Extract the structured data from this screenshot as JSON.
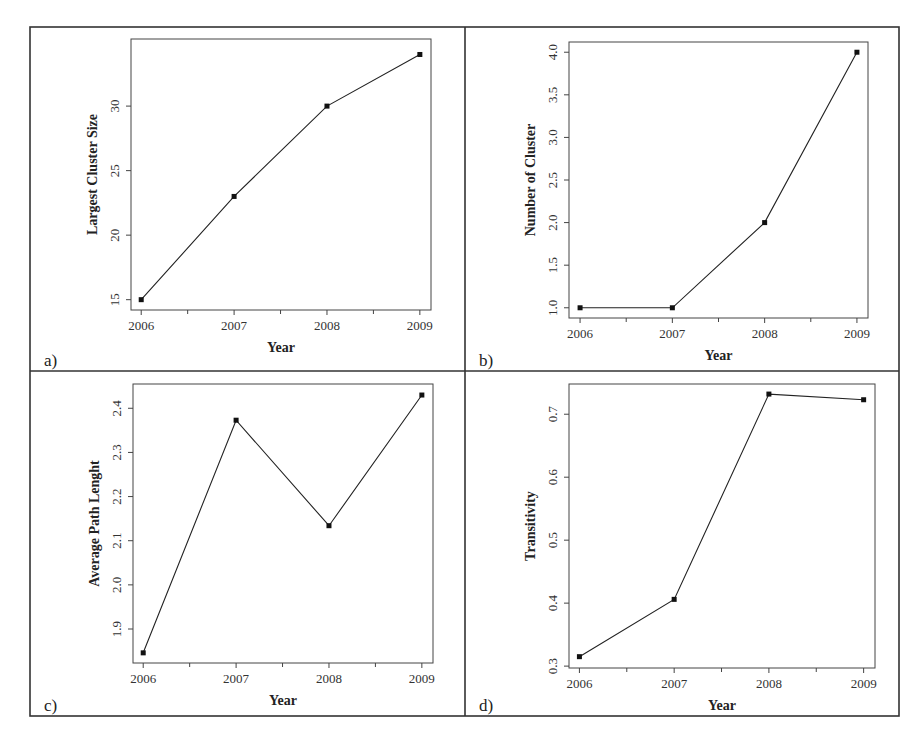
{
  "figure": {
    "layout": "2x2 grid of line charts",
    "frame_color": "#333333"
  },
  "chart_data": [
    {
      "id": "a",
      "panel_label": "a)",
      "type": "line",
      "title": "",
      "xlabel": "Year",
      "ylabel": "Largest Cluster Size",
      "x": [
        2006,
        2007,
        2008,
        2009
      ],
      "x_tick_labels": [
        "2006",
        "2007",
        "2008",
        "2009"
      ],
      "x_minor_ticks": [
        2006.5,
        2007.5,
        2008.5
      ],
      "values": [
        15,
        23,
        30,
        34
      ],
      "y_ticks": [
        15,
        20,
        25,
        30
      ],
      "y_tick_labels": [
        "15",
        "20",
        "25",
        "30"
      ],
      "ylim": [
        14.2,
        35.2
      ],
      "xlim": [
        2005.89,
        2009.12
      ],
      "grid": false,
      "marker": "square",
      "line_color": "#222222"
    },
    {
      "id": "b",
      "panel_label": "b)",
      "type": "line",
      "title": "",
      "xlabel": "Year",
      "ylabel": "Number of Cluster",
      "x": [
        2006,
        2007,
        2008,
        2009
      ],
      "x_tick_labels": [
        "2006",
        "2007",
        "2008",
        "2009"
      ],
      "x_minor_ticks": [
        2006.5,
        2007.5,
        2008.5
      ],
      "values": [
        1,
        1,
        2,
        4
      ],
      "y_ticks": [
        1.0,
        1.5,
        2.0,
        2.5,
        3.0,
        3.5,
        4.0
      ],
      "y_tick_labels": [
        "1.0",
        "1.5",
        "2.0",
        "2.5",
        "3.0",
        "3.5",
        "4.0"
      ],
      "ylim": [
        0.88,
        4.12
      ],
      "xlim": [
        2005.88,
        2009.12
      ],
      "grid": false,
      "marker": "square",
      "line_color": "#222222"
    },
    {
      "id": "c",
      "panel_label": "c)",
      "type": "line",
      "title": "",
      "xlabel": "Year",
      "ylabel": "Average Path Lenght",
      "x": [
        2006,
        2007,
        2008,
        2009
      ],
      "x_tick_labels": [
        "2006",
        "2007",
        "2008",
        "2009"
      ],
      "x_minor_ticks": [
        2006.5,
        2007.5,
        2008.5
      ],
      "values": [
        1.846,
        2.373,
        2.134,
        2.43
      ],
      "y_ticks": [
        1.9,
        2.0,
        2.1,
        2.2,
        2.3,
        2.4
      ],
      "y_tick_labels": [
        "1.9",
        "2.0",
        "2.1",
        "2.2",
        "2.3",
        "2.4"
      ],
      "ylim": [
        1.823,
        2.455
      ],
      "xlim": [
        2005.89,
        2009.12
      ],
      "grid": false,
      "marker": "square",
      "line_color": "#222222"
    },
    {
      "id": "d",
      "panel_label": "d)",
      "type": "line",
      "title": "",
      "xlabel": "Year",
      "ylabel": "Transitivity",
      "x": [
        2006,
        2007,
        2008,
        2009
      ],
      "x_tick_labels": [
        "2006",
        "2007",
        "2008",
        "2009"
      ],
      "x_minor_ticks": [
        2006.5,
        2007.5,
        2008.5
      ],
      "values": [
        0.315,
        0.406,
        0.732,
        0.723
      ],
      "y_ticks": [
        0.3,
        0.4,
        0.5,
        0.6,
        0.7
      ],
      "y_tick_labels": [
        "0.3",
        "0.4",
        "0.5",
        "0.6",
        "0.7"
      ],
      "ylim": [
        0.297,
        0.748
      ],
      "xlim": [
        2005.89,
        2009.12
      ],
      "grid": false,
      "marker": "square",
      "line_color": "#222222"
    }
  ]
}
